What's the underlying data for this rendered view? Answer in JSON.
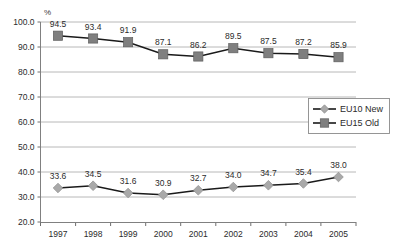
{
  "chart_data": {
    "type": "line",
    "title": "",
    "subtitle": "",
    "xlabel": "",
    "ylabel": "%",
    "unit_label": "%",
    "categories": [
      "1997",
      "1998",
      "1999",
      "2000",
      "2001",
      "2002",
      "2003",
      "2004",
      "2005"
    ],
    "ylim": [
      20.0,
      100.0
    ],
    "ytick_labels": [
      "100.0",
      "90.0",
      "80.0",
      "70.0",
      "60.0",
      "50.0",
      "40.0",
      "30.0",
      "20.0"
    ],
    "ytick_values": [
      100.0,
      90.0,
      80.0,
      70.0,
      60.0,
      50.0,
      40.0,
      30.0,
      20.0
    ],
    "grid": true,
    "legend_position": "right-middle",
    "series": [
      {
        "name": "EU10 New",
        "marker": "diamond",
        "color": "#a9a9a9",
        "values": [
          33.6,
          34.5,
          31.6,
          30.9,
          32.7,
          34.0,
          34.7,
          35.4,
          38.0
        ],
        "labels": [
          "33.6",
          "34.5",
          "31.6",
          "30.9",
          "32.7",
          "34.0",
          "34.7",
          "35.4",
          "38.0"
        ]
      },
      {
        "name": "EU15 Old",
        "marker": "square",
        "color": "#7f7f7f",
        "values": [
          94.5,
          93.4,
          91.9,
          87.1,
          86.2,
          89.5,
          87.5,
          87.2,
          85.9
        ],
        "labels": [
          "94.5",
          "93.4",
          "91.9",
          "87.1",
          "86.2",
          "89.5",
          "87.5",
          "87.2",
          "85.9"
        ]
      }
    ]
  },
  "legend": {
    "items": [
      {
        "label": "EU10 New"
      },
      {
        "label": "EU15 Old"
      }
    ]
  },
  "colors": {
    "eu10_marker": "#a9a9a9",
    "eu15_marker": "#7f7f7f",
    "line": "#1a1a1a",
    "gridline": "#b0b0b0",
    "background": "#ffffff"
  }
}
